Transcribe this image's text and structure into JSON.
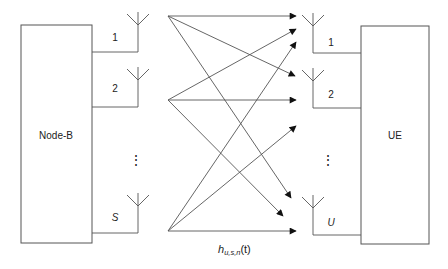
{
  "diagram": {
    "transmitter": {
      "label": "Node-B",
      "antennas": [
        {
          "label": "1",
          "italic": false
        },
        {
          "label": "2",
          "italic": false
        },
        {
          "label": "S",
          "italic": true
        }
      ],
      "ellipsis": "⋮"
    },
    "receiver": {
      "label": "UE",
      "antennas": [
        {
          "label": "1",
          "italic": false
        },
        {
          "label": "2",
          "italic": false
        },
        {
          "label": "U",
          "italic": true
        }
      ],
      "ellipsis": "⋮"
    },
    "channel_label": {
      "base": "h",
      "subscript": "u,s,n",
      "arg": "(t)"
    },
    "links": [
      {
        "from": "1",
        "to": "1"
      },
      {
        "from": "1",
        "to": "2"
      },
      {
        "from": "1",
        "to": "U"
      },
      {
        "from": "2",
        "to": "1"
      },
      {
        "from": "2",
        "to": "2"
      },
      {
        "from": "2",
        "to": "U"
      },
      {
        "from": "S",
        "to": "1"
      },
      {
        "from": "S",
        "to": "2"
      },
      {
        "from": "S",
        "to": "U"
      }
    ],
    "colors": {
      "line": "#555555",
      "text": "#222222",
      "background": "#ffffff"
    }
  }
}
